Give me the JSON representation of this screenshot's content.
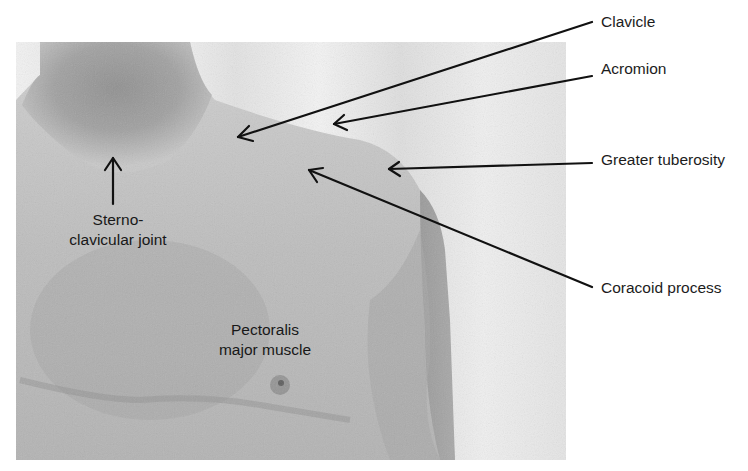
{
  "figure": {
    "type": "anatomical-photo-annotation",
    "labels": {
      "clavicle": "Clavicle",
      "acromion": "Acromion",
      "greater_tuberosity": "Greater tuberosity",
      "coracoid_process": "Coracoid process",
      "sternoclavicular_line1": "Sterno-",
      "sternoclavicular_line2": "clavicular joint",
      "pectoralis_line1": "Pectoralis",
      "pectoralis_line2": "major muscle"
    },
    "annotations": [
      {
        "label": "Clavicle",
        "from": [
          592,
          22
        ],
        "to": [
          238,
          137
        ]
      },
      {
        "label": "Acromion",
        "from": [
          592,
          76
        ],
        "to": [
          334,
          124
        ]
      },
      {
        "label": "Greater tuberosity",
        "from": [
          592,
          163
        ],
        "to": [
          389,
          169
        ]
      },
      {
        "label": "Coracoid process",
        "from": [
          592,
          287
        ],
        "to": [
          309,
          170
        ]
      },
      {
        "label": "Sterno-clavicular joint",
        "from": [
          113,
          204
        ],
        "to": [
          113,
          158
        ]
      }
    ],
    "colors": {
      "background": "#ffffff",
      "arrow": "#111111",
      "text": "#1c1c1c"
    }
  }
}
